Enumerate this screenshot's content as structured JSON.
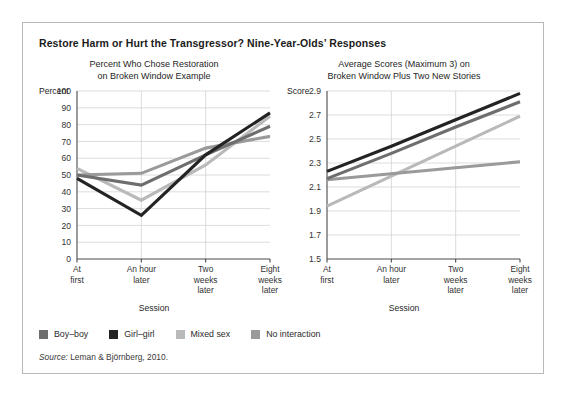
{
  "figure": {
    "title": "Restore Harm or Hurt the Transgressor? Nine-Year-Olds’ Responses",
    "source_prefix": "Source:",
    "source_text": " Leman & Björnberg, 2010."
  },
  "legend": {
    "position": "bottom-left",
    "items": [
      {
        "label": "Boy–boy",
        "color": "#6e6e6e"
      },
      {
        "label": "Girl–girl",
        "color": "#232323"
      },
      {
        "label": "Mixed sex",
        "color": "#b9b9b9"
      },
      {
        "label": "No interaction",
        "color": "#9a9a9a"
      }
    ]
  },
  "chart_data": [
    {
      "id": "left",
      "type": "line",
      "title_line1": "Percent Who Chose Restoration",
      "title_line2": "on Broken Window Example",
      "xlabel": "Session",
      "ylabel": "Percent",
      "grid": true,
      "ylim": [
        0,
        100
      ],
      "yticks": [
        0,
        10,
        20,
        30,
        40,
        50,
        60,
        70,
        80,
        90,
        100
      ],
      "categories": [
        "At first",
        "An hour later",
        "Two weeks later",
        "Eight weeks later"
      ],
      "category_lines": [
        [
          "At",
          "first"
        ],
        [
          "An hour",
          "later"
        ],
        [
          "Two",
          "weeks",
          "later"
        ],
        [
          "Eight",
          "weeks",
          "later"
        ]
      ],
      "series": [
        {
          "name": "Boy–boy",
          "color": "#6e6e6e",
          "values": [
            50,
            44,
            62,
            79
          ]
        },
        {
          "name": "Girl–girl",
          "color": "#232323",
          "values": [
            48,
            26,
            62,
            87
          ]
        },
        {
          "name": "Mixed sex",
          "color": "#b9b9b9",
          "values": [
            54,
            35,
            56,
            85
          ]
        },
        {
          "name": "No interaction",
          "color": "#9a9a9a",
          "values": [
            50,
            51,
            66,
            73
          ]
        }
      ]
    },
    {
      "id": "right",
      "type": "line",
      "title_line1": "Average Scores (Maximum 3) on",
      "title_line2": "Broken Window Plus Two New Stories",
      "xlabel": "Session",
      "ylabel": "Score",
      "grid": true,
      "ylim": [
        1.5,
        2.9
      ],
      "yticks": [
        1.5,
        1.7,
        1.9,
        2.1,
        2.3,
        2.5,
        2.7,
        2.9
      ],
      "categories": [
        "At first",
        "An hour later",
        "Two weeks later",
        "Eight weeks later"
      ],
      "category_lines": [
        [
          "At",
          "first"
        ],
        [
          "An hour",
          "later"
        ],
        [
          "Two",
          "weeks",
          "later"
        ],
        [
          "Eight",
          "weeks",
          "later"
        ]
      ],
      "series": [
        {
          "name": "Boy–boy",
          "color": "#6e6e6e",
          "values": [
            2.17,
            2.38,
            2.6,
            2.81
          ]
        },
        {
          "name": "Girl–girl",
          "color": "#232323",
          "values": [
            2.23,
            2.44,
            2.66,
            2.88
          ]
        },
        {
          "name": "Mixed sex",
          "color": "#b9b9b9",
          "values": [
            1.94,
            2.19,
            2.44,
            2.69
          ]
        },
        {
          "name": "No interaction",
          "color": "#9a9a9a",
          "values": [
            2.16,
            2.21,
            2.26,
            2.31
          ]
        }
      ]
    }
  ]
}
